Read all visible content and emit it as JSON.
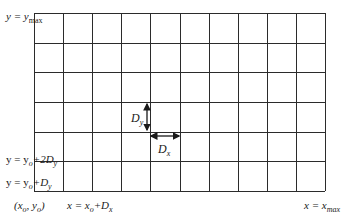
{
  "diagram": {
    "type": "computational-grid",
    "grid": {
      "columns": 10,
      "rows": 6,
      "left": 34,
      "top": 13,
      "right": 325,
      "bottom": 191,
      "line_color": "#2b2b2b"
    },
    "labels": {
      "y_max": {
        "prefix": "y = y",
        "sub": "max"
      },
      "y_2dy": {
        "prefix": "y = y",
        "sub": "o",
        "suffix": "+2D",
        "suffix_sub": "y"
      },
      "y_dy": {
        "prefix": "y = y",
        "sub": "o",
        "suffix": "+D",
        "suffix_sub": "y"
      },
      "origin": {
        "text": "(x",
        "sub1": "o",
        "mid": ", y",
        "sub2": "o",
        "end": ")"
      },
      "x_dx": {
        "prefix": "x = x",
        "sub": "o",
        "suffix": "+D",
        "suffix_sub": "x"
      },
      "x_max": {
        "prefix": "x = x",
        "sub": "max"
      },
      "dy_label": {
        "main": "D",
        "sub": "y"
      },
      "dx_label": {
        "main": "D",
        "sub": "x"
      }
    }
  }
}
